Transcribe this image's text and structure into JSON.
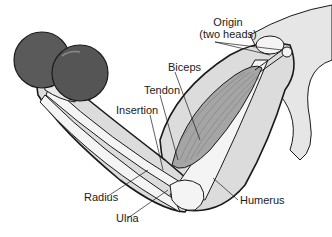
{
  "diagram": {
    "labels": {
      "origin_line1": "Origin",
      "origin_line2": "(two heads)",
      "biceps": "Biceps",
      "tendon": "Tendon",
      "insertion": "Insertion",
      "radius": "Radius",
      "ulna": "Ulna",
      "humerus": "Humerus"
    },
    "colors": {
      "background": "#ffffff",
      "dumbbell": "#555555",
      "skin": "#d9d9d9",
      "bone": "#f2f2f2",
      "muscle": "#9a9a9a",
      "outline": "#1a1a1a"
    }
  }
}
